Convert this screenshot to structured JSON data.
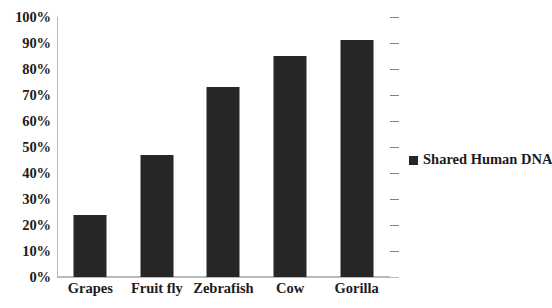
{
  "chart_data": {
    "type": "bar",
    "title": "",
    "subtitle": "",
    "xlabel": "",
    "ylabel": "",
    "categories": [
      "Grapes",
      "Fruit fly",
      "Zebrafish",
      "Cow",
      "Gorilla"
    ],
    "series": [
      {
        "name": "Shared Human DNA",
        "values": [
          24,
          47,
          73,
          85,
          91
        ]
      }
    ],
    "ylim": [
      0,
      100
    ],
    "y_tick_values": [
      0,
      10,
      20,
      30,
      40,
      50,
      60,
      70,
      80,
      90,
      100
    ],
    "y_tick_labels": [
      "0%",
      "10%",
      "20%",
      "30%",
      "40%",
      "50%",
      "60%",
      "70%",
      "80%",
      "90%",
      "100%"
    ],
    "value_suffix": "%",
    "grid": true,
    "grid_axis": "y",
    "legend_position": "right",
    "bar_color": "#262626",
    "gridline_color": "#808080",
    "axis_color": "#b9b9b9",
    "background_color": "#ffffff",
    "text_color": "#1c1c1c"
  },
  "legend": {
    "entries": [
      {
        "label": "Shared Human DNA",
        "marker": "square-marker",
        "color": "#262626"
      }
    ]
  }
}
